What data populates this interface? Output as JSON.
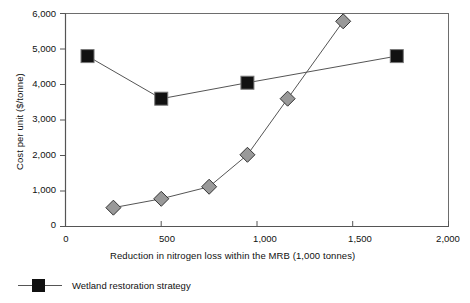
{
  "chart_data": {
    "type": "line",
    "title": "",
    "xlabel": "Reduction in nitrogen loss within the MRB (1,000 tonnes)",
    "ylabel": "Cost per unit ($/tonne)",
    "xlim": [
      0,
      2000
    ],
    "ylim": [
      0,
      6000
    ],
    "xticks": [
      0,
      500,
      1000,
      1500,
      2000
    ],
    "xtick_labels": [
      "0",
      "500",
      "1,000",
      "1,500",
      "2,000"
    ],
    "yticks": [
      0,
      1000,
      2000,
      3000,
      4000,
      5000,
      6000
    ],
    "ytick_labels": [
      "0",
      "1,000",
      "2,000",
      "3,000",
      "4,000",
      "5,000",
      "6,000"
    ],
    "grid": false,
    "legend_position": "below-plot",
    "series": [
      {
        "name": "Wetland restoration strategy",
        "marker": "square",
        "marker_color": "#111111",
        "line_color": "#555555",
        "points": [
          {
            "x": 115,
            "y": 4800
          },
          {
            "x": 500,
            "y": 3600
          },
          {
            "x": 950,
            "y": 4050
          },
          {
            "x": 1730,
            "y": 4800
          }
        ]
      },
      {
        "name": "",
        "marker": "diamond",
        "marker_color": "#999999",
        "line_color": "#555555",
        "points": [
          {
            "x": 250,
            "y": 530
          },
          {
            "x": 500,
            "y": 780
          },
          {
            "x": 750,
            "y": 1120
          },
          {
            "x": 950,
            "y": 2020
          },
          {
            "x": 1160,
            "y": 3600
          },
          {
            "x": 1450,
            "y": 5780
          }
        ]
      }
    ]
  },
  "legend": {
    "entries": [
      {
        "label": "Wetland restoration strategy",
        "marker": "square",
        "color": "#111111"
      }
    ]
  },
  "axes": {
    "y_title": "Cost per unit ($/tonne)",
    "x_title": "Reduction in nitrogen loss within the MRB (1,000 tonnes)"
  },
  "colors": {
    "frame": "#6d6d6d",
    "axis": "#555555",
    "series_square": "#111111",
    "series_diamond": "#999999",
    "background": "#ffffff"
  }
}
